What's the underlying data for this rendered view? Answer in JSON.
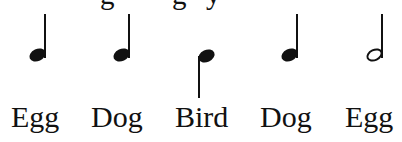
{
  "cropped_text_fragment": {
    "note": "Top line of text cut off at image edge; only descenders visible",
    "fragments": [
      "g",
      "g",
      "y"
    ]
  },
  "notes": [
    {
      "type": "quarter",
      "stem": "up",
      "label": "Egg"
    },
    {
      "type": "quarter",
      "stem": "up",
      "label": "Dog"
    },
    {
      "type": "quarter",
      "stem": "down",
      "label": "Bird"
    },
    {
      "type": "quarter",
      "stem": "up",
      "label": "Dog"
    },
    {
      "type": "half",
      "stem": "up",
      "label": "Egg"
    }
  ],
  "colors": {
    "ink": "#111111",
    "background": "#ffffff"
  }
}
